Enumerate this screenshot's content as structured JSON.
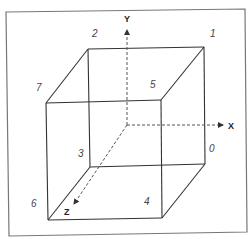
{
  "diagram": {
    "vertex_labels": {
      "v0": "0",
      "v1": "1",
      "v2": "2",
      "v3": "3",
      "v4": "4",
      "v5": "5",
      "v6": "6",
      "v7": "7"
    },
    "axes": {
      "x": "X",
      "y": "Y",
      "z": "Z"
    },
    "colors": {
      "edge": "#333333",
      "frame": "#777777",
      "axis": "#555555"
    }
  }
}
